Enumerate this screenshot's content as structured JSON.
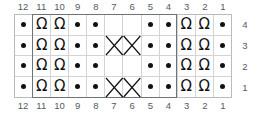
{
  "chart_data": {
    "type": "table",
    "title": "",
    "kind": "knitting-cable-chart",
    "columns": 12,
    "rows": 4,
    "column_numbers_top": [
      "12",
      "11",
      "10",
      "9",
      "8",
      "7",
      "6",
      "5",
      "4",
      "3",
      "2",
      "1"
    ],
    "column_numbers_bottom": [
      "12",
      "11",
      "10",
      "9",
      "8",
      "7",
      "6",
      "5",
      "4",
      "3",
      "2",
      "1"
    ],
    "row_numbers": [
      "4",
      "3",
      "2",
      "1"
    ],
    "symbol_legend": {
      "dot": "purl-stitch",
      "omega": "twisted-knit-stitch",
      "blank": "knit-stitch",
      "cross-right": "right-leaning-cable-cross",
      "cross-left": "left-leaning-cable-cross"
    },
    "colors": {
      "ink": "#111111",
      "grid_line": "#d2d4d6",
      "outer_border": "#b9bcbe",
      "repeat_border": "#6e7376",
      "number_text": "#555a5e",
      "background": "#ffffff"
    },
    "repeat_box": {
      "start_column": "11",
      "end_column": "4"
    },
    "cells": [
      [
        "dot",
        "omega",
        "omega",
        "dot",
        "dot",
        "blank",
        "blank",
        "dot",
        "dot",
        "omega",
        "omega",
        "dot"
      ],
      [
        "dot",
        "omega",
        "omega",
        "dot",
        "dot",
        "cross-right",
        "cross-left",
        "dot",
        "dot",
        "omega",
        "omega",
        "dot"
      ],
      [
        "dot",
        "omega",
        "omega",
        "dot",
        "dot",
        "blank",
        "blank",
        "dot",
        "dot",
        "omega",
        "omega",
        "dot"
      ],
      [
        "dot",
        "omega",
        "omega",
        "dot",
        "dot",
        "cross-down-right",
        "cross-down-left",
        "dot",
        "dot",
        "omega",
        "omega",
        "dot"
      ]
    ],
    "glyphs": {
      "omega": "Ω"
    }
  }
}
